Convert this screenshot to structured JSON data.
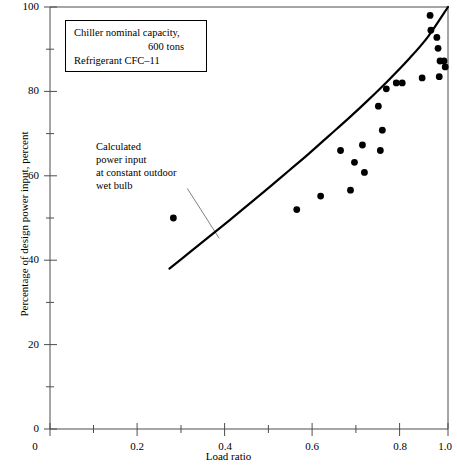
{
  "figure": {
    "background_color": "#ffffff",
    "ink_color": "#000000"
  },
  "caption_box": {
    "lines": [
      "Chiller nominal capacity,",
      "600 tons",
      "Refrigerant CFC‒11"
    ]
  },
  "annotation": {
    "lines": [
      "Calculated",
      "power input",
      "at constant outdoor",
      "wet bulb"
    ]
  },
  "chart_data": {
    "type": "scatter",
    "title": "",
    "subtitle": "",
    "xlabel": "Load ratio",
    "ylabel": "Percentage of design power input, percent",
    "xlim": [
      0.0,
      1.0
    ],
    "ylim": [
      0,
      100
    ],
    "grid": false,
    "legend_position": "none",
    "x_ticks": [
      0,
      0.2,
      0.4,
      0.6,
      0.8,
      1.0
    ],
    "x_tick_labels": [
      "0",
      "0.2",
      "0.4",
      "0.6",
      "0.8",
      "1.0"
    ],
    "x_minor_ticks": [
      0.1,
      0.3,
      0.5,
      0.7,
      0.9
    ],
    "y_ticks": [
      0,
      20,
      40,
      60,
      80,
      100
    ],
    "y_tick_labels": [
      "0",
      "20",
      "40",
      "60",
      "80",
      "100"
    ],
    "y_minor_ticks": [
      10,
      30,
      50,
      70,
      90
    ],
    "series": [
      {
        "name": "Calculated power input at constant outdoor wet bulb",
        "type": "line",
        "marker": "none",
        "line_width": 2.2,
        "color": "#000000",
        "x": [
          0.3,
          0.35,
          0.4,
          0.45,
          0.5,
          0.55,
          0.6,
          0.65,
          0.7,
          0.75,
          0.8,
          0.85,
          0.9,
          0.95,
          1.0
        ],
        "y": [
          38.0,
          41.8,
          45.6,
          49.4,
          53.3,
          57.2,
          61.2,
          65.2,
          69.4,
          73.6,
          78.0,
          82.6,
          87.5,
          93.0,
          100.0
        ]
      },
      {
        "name": "Measured power input",
        "type": "scatter",
        "marker": "circle",
        "marker_size": 3.4,
        "color": "#000000",
        "points": [
          [
            0.31,
            50.0
          ],
          [
            0.62,
            52.0
          ],
          [
            0.68,
            55.2
          ],
          [
            0.73,
            66.0
          ],
          [
            0.755,
            56.6
          ],
          [
            0.765,
            63.2
          ],
          [
            0.785,
            67.3
          ],
          [
            0.79,
            60.8
          ],
          [
            0.825,
            76.5
          ],
          [
            0.83,
            66.0
          ],
          [
            0.835,
            70.8
          ],
          [
            0.845,
            80.6
          ],
          [
            0.87,
            82.0
          ],
          [
            0.885,
            82.0
          ],
          [
            0.935,
            83.2
          ],
          [
            0.955,
            98.0
          ],
          [
            0.957,
            94.5
          ],
          [
            0.972,
            92.8
          ],
          [
            0.975,
            90.2
          ],
          [
            0.978,
            83.5
          ],
          [
            0.98,
            87.2
          ],
          [
            0.99,
            87.2
          ],
          [
            0.993,
            85.8
          ]
        ]
      }
    ],
    "annotations": [
      {
        "text": "Calculated power input at constant outdoor wet bulb",
        "leader_from": [
          0.345,
          57.0
        ],
        "leader_to": [
          0.425,
          45.2
        ]
      },
      {
        "text": "Chiller nominal capacity, 600 tons Refrigerant CFC‒11",
        "boxed": true
      }
    ]
  }
}
